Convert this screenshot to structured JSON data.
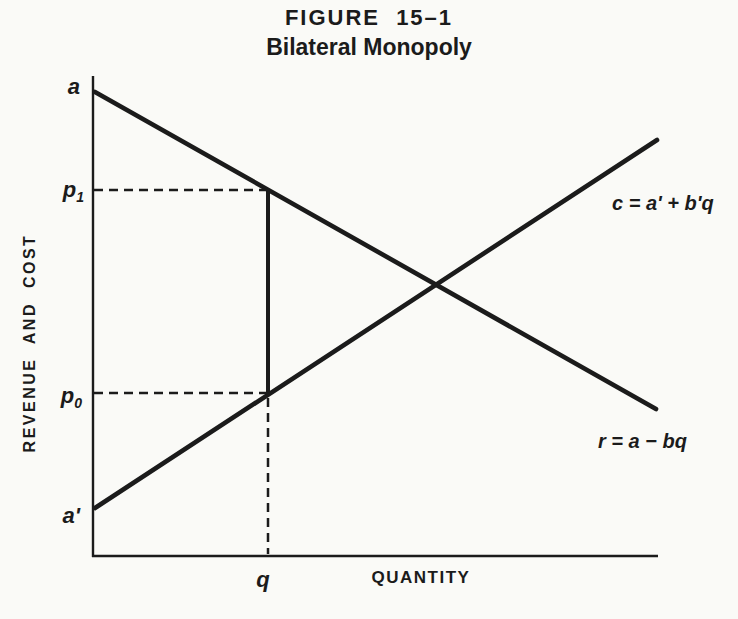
{
  "page": {
    "background_color": "#fafaf7",
    "ink_color": "#1b1b1b"
  },
  "header": {
    "figure_label": "FIGURE 15–1",
    "figure_title": "Bilateral Monopoly"
  },
  "axes": {
    "y_axis_label": "REVENUE AND COST",
    "x_axis_label": "QUANTITY"
  },
  "chart_data": {
    "type": "line",
    "title": "FIGURE 15–1",
    "subtitle": "Bilateral Monopoly",
    "xlabel": "QUANTITY",
    "ylabel": "REVENUE AND COST",
    "grid": false,
    "numeric_ticks": false,
    "lines": [
      {
        "name": "y-axis",
        "x1": 93,
        "y1": 76,
        "x2": 93,
        "y2": 557,
        "width": 2.4,
        "dash": "",
        "cap": "butt"
      },
      {
        "name": "x-axis",
        "x1": 92,
        "y1": 556,
        "x2": 658,
        "y2": 556,
        "width": 2.4,
        "dash": "",
        "cap": "butt"
      },
      {
        "name": "revenue-line",
        "x1": 95,
        "y1": 92,
        "x2": 656,
        "y2": 409,
        "width": 4.6,
        "dash": "",
        "cap": "round",
        "equation": "r = a − bq"
      },
      {
        "name": "cost-line",
        "x1": 95,
        "y1": 508,
        "x2": 657,
        "y2": 140,
        "width": 4.6,
        "dash": "",
        "cap": "round",
        "equation": "c = a' + b'q"
      },
      {
        "name": "price-range-segment",
        "x1": 268,
        "y1": 189,
        "x2": 268,
        "y2": 396,
        "width": 4.0,
        "dash": "",
        "cap": "butt"
      },
      {
        "name": "p1-dashed-guide",
        "x1": 94,
        "y1": 190,
        "x2": 266,
        "y2": 190,
        "width": 2.5,
        "dash": "9 6",
        "cap": "butt"
      },
      {
        "name": "p0-dashed-guide",
        "x1": 94,
        "y1": 393,
        "x2": 266,
        "y2": 393,
        "width": 2.5,
        "dash": "9 6",
        "cap": "butt"
      },
      {
        "name": "q-dashed-guide",
        "x1": 268,
        "y1": 398,
        "x2": 268,
        "y2": 554,
        "width": 2.5,
        "dash": "9 6",
        "cap": "butt"
      }
    ],
    "point_labels": [
      {
        "name": "label-a",
        "base": "a",
        "sub": "",
        "x": 80,
        "y": 94,
        "anchor": "end",
        "size": 22
      },
      {
        "name": "label-p1",
        "base": "p",
        "sub": "1",
        "x": 84,
        "y": 197,
        "anchor": "end",
        "size": 22
      },
      {
        "name": "label-p0",
        "base": "p",
        "sub": "0",
        "x": 82,
        "y": 403,
        "anchor": "end",
        "size": 22
      },
      {
        "name": "label-a-prime",
        "base": "a'",
        "sub": "",
        "x": 80,
        "y": 523,
        "anchor": "end",
        "size": 22
      },
      {
        "name": "label-q",
        "base": "q",
        "sub": "",
        "x": 263,
        "y": 587,
        "anchor": "middle",
        "size": 22
      },
      {
        "name": "label-cost-equation",
        "base": "c = a' + b'q",
        "sub": "",
        "x": 612,
        "y": 210,
        "anchor": "start",
        "size": 20
      },
      {
        "name": "label-revenue-equation",
        "base": "r = a − bq",
        "sub": "",
        "x": 598,
        "y": 448,
        "anchor": "start",
        "size": 20
      }
    ],
    "key_points_px": {
      "contract_quantity_x": 268,
      "upper_price_y": 190,
      "lower_price_y": 393,
      "lines_intersection": [
        437,
        285
      ]
    }
  }
}
